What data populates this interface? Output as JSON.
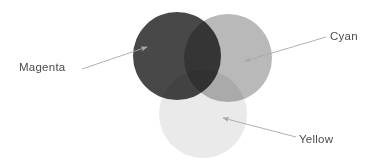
{
  "figure": {
    "background_color": "#ffffff",
    "width": 383,
    "height": 165
  },
  "labels": {
    "magenta": "Magenta",
    "cyan": "Cyan",
    "yellow": "Yellow"
  },
  "label_color": "#4c4c4c",
  "chart_data": {
    "type": "diagram",
    "subtype": "venn",
    "background": "#ffffff",
    "blend_mode": "multiply",
    "sets": [
      {
        "name": "Magenta",
        "label": "Magenta",
        "cx": 177,
        "cy": 56,
        "r": 44,
        "fill": "#3a3a3a",
        "opacity": 0.93,
        "label_x": 19,
        "label_y": 62,
        "arrow": {
          "from_x": 82,
          "from_y": 69,
          "to_x": 147,
          "to_y": 47
        }
      },
      {
        "name": "Cyan",
        "label": "Cyan",
        "cx": 228,
        "cy": 58,
        "r": 44,
        "fill": "#b4b4b4",
        "opacity": 0.93,
        "label_x": 330,
        "label_y": 31,
        "arrow": {
          "from_x": 326,
          "from_y": 37,
          "to_x": 245,
          "to_y": 61
        }
      },
      {
        "name": "Yellow",
        "label": "Yellow",
        "cx": 203,
        "cy": 114,
        "r": 44,
        "fill": "#e9e9e9",
        "opacity": 0.93,
        "label_x": 299,
        "label_y": 134,
        "arrow": {
          "from_x": 296,
          "from_y": 137,
          "to_x": 223,
          "to_y": 118
        }
      }
    ],
    "arrow_color": "#a8a8a8",
    "arrow_width": 0.9,
    "legend": "none",
    "grid": false,
    "axis": "none"
  }
}
